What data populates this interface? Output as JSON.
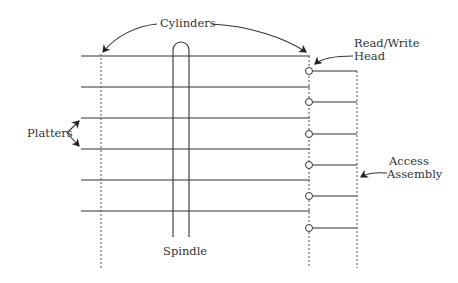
{
  "diagram": {
    "labels": {
      "cylinders": "Cylinders",
      "read_write_head_line1": "Read/Write",
      "read_write_head_line2": "Head",
      "platters": "Platters",
      "access_line1": "Access",
      "access_line2": "Assembly",
      "spindle": "Spindle"
    },
    "platter_count": 6,
    "head_count": 6,
    "colors": {
      "stroke": "#333333",
      "background": "#ffffff"
    }
  }
}
